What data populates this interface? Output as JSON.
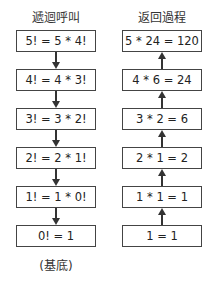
{
  "left_column": {
    "title": "遞迴呼叫",
    "boxes": [
      "5! = 5 * 4!",
      "4! = 4 * 3!",
      "3! = 3 * 2!",
      "2! = 2 * 1!",
      "1! = 1 * 0!",
      "0! = 1"
    ],
    "arrow_direction": "down",
    "note": "(基底)"
  },
  "right_column": {
    "title": "返回過程",
    "boxes": [
      "5 * 24 = 120",
      "4 * 6 = 24",
      "3 * 2 = 6",
      "2 * 1 = 2",
      "1 * 1 = 1",
      "1 = 1"
    ],
    "arrow_direction": "up"
  }
}
